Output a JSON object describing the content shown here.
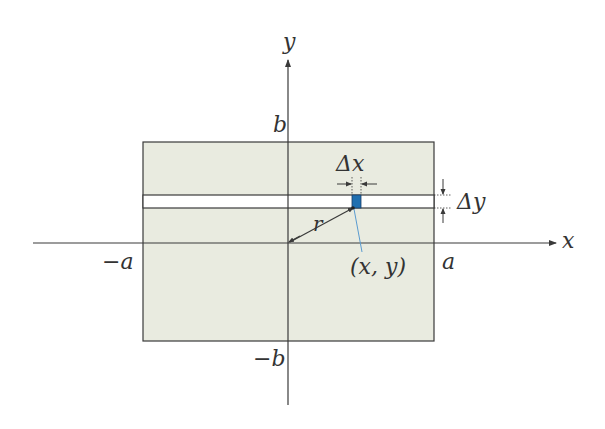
{
  "diagram": {
    "type": "rectangular region with area element",
    "colors": {
      "region_fill": "#e9ebe0",
      "line": "#3a3a3a",
      "element_fill": "#1f6fb0",
      "pointer_line": "#5a9bd0",
      "strip_fill": "#ffffff"
    },
    "axes": {
      "x_label": "x",
      "y_label": "y"
    },
    "ticks": {
      "neg_a": "−a",
      "pos_a": "a",
      "pos_b": "b",
      "neg_b": "−b"
    },
    "annotations": {
      "delta_x": "Δx",
      "delta_y": "Δy",
      "radius": "r",
      "point": "(x, y)"
    }
  }
}
